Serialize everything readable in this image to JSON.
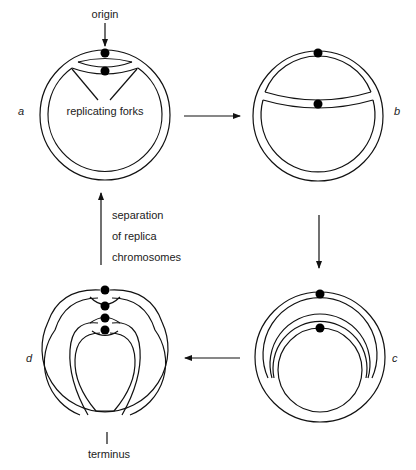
{
  "diagram": {
    "labels": {
      "origin": "origin",
      "replicating_forks": "replicating forks",
      "separation_line1": "separation",
      "separation_line2": "of replica",
      "separation_line3": "chromosomes",
      "terminus": "terminus"
    },
    "stages": [
      {
        "id": "a",
        "label": "a",
        "description": "replication begins at origin; two forks"
      },
      {
        "id": "b",
        "label": "b",
        "description": "forks progress around the circle"
      },
      {
        "id": "c",
        "label": "c",
        "description": "replication nearly complete"
      },
      {
        "id": "d",
        "label": "d",
        "description": "forks meet at terminus; replicas interlinked"
      }
    ],
    "arrows": [
      {
        "from": "a",
        "to": "b",
        "direction": "right"
      },
      {
        "from": "b",
        "to": "c",
        "direction": "down"
      },
      {
        "from": "c",
        "to": "d",
        "direction": "left"
      },
      {
        "from": "d",
        "to": "a",
        "direction": "up",
        "label": "separation of replica chromosomes"
      }
    ],
    "colors": {
      "line": "#111111",
      "background": "#ffffff",
      "dot": "#000000"
    }
  }
}
